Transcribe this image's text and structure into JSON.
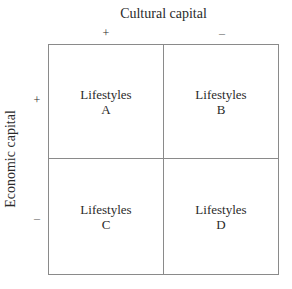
{
  "diagram": {
    "x_axis": {
      "title": "Cultural capital",
      "plus": "+",
      "minus": "–"
    },
    "y_axis": {
      "title": "Economic capital",
      "plus": "+",
      "minus": "–"
    },
    "cells": [
      {
        "label": "Lifestyles",
        "letter": "A"
      },
      {
        "label": "Lifestyles",
        "letter": "B"
      },
      {
        "label": "Lifestyles",
        "letter": "C"
      },
      {
        "label": "Lifestyles",
        "letter": "D"
      }
    ]
  }
}
